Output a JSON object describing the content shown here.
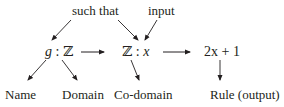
{
  "diagram": {
    "top_labels": {
      "such_that": "such that",
      "input": "input"
    },
    "middle_row": {
      "g_name": "g",
      "g_colon": ":",
      "g_domain": "ℤ",
      "codomain_set": "ℤ",
      "codomain_colon": ":",
      "codomain_var": "x",
      "rule": "2x + 1"
    },
    "bottom_labels": {
      "name": "Name",
      "domain": "Domain",
      "codomain": "Co-domain",
      "rule": "Rule (output)"
    },
    "colors": {
      "text": "#231f20",
      "arrow": "#231f20",
      "background": "#ffffff"
    }
  }
}
